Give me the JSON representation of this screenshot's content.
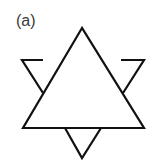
{
  "figure": {
    "label": "(a)",
    "stroke_color": "#111111",
    "background": "#ffffff",
    "shapes": {
      "large_triangle": [
        [
          82,
          28
        ],
        [
          23,
          128
        ],
        [
          144,
          128
        ]
      ],
      "top_left_small_triangle": [
        [
          22,
          60
        ],
        [
          62,
          60
        ],
        [
          43,
          93
        ]
      ],
      "top_right_small_triangle": [
        [
          103,
          60
        ],
        [
          144,
          60
        ],
        [
          123,
          93
        ]
      ],
      "bottom_small_triangle": [
        [
          65,
          128
        ],
        [
          101,
          128
        ],
        [
          82,
          158
        ]
      ]
    }
  }
}
